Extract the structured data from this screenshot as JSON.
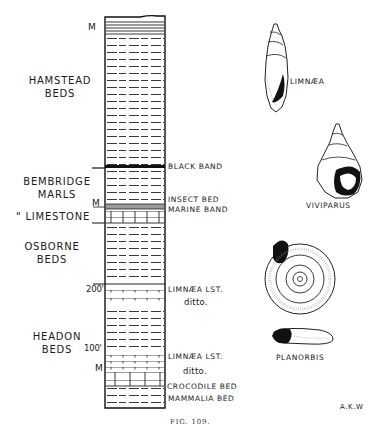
{
  "figure": {
    "caption": "FIG. 109.",
    "signature": "A.K.W"
  },
  "units": [
    {
      "name": "HAMSTEAD",
      "sub": "BEDS"
    },
    {
      "name": "BEMBRIDGE",
      "sub": "MARLS"
    },
    {
      "name": "\" LIMESTONE",
      "sub": ""
    },
    {
      "name": "OSBORNE",
      "sub": "BEDS"
    },
    {
      "name": "HEADON",
      "sub": "BEDS"
    }
  ],
  "side_marks": {
    "m_top": "M",
    "m_marine": "M",
    "m_lower": "M",
    "depth_200": "200'",
    "depth_100": "100'"
  },
  "bed_labels": [
    {
      "text": "BLACK BAND"
    },
    {
      "text": "INSECT BED"
    },
    {
      "text": "MARINE BAND"
    },
    {
      "text": "LIMNÆA LST."
    },
    {
      "text": "ditto."
    },
    {
      "text": "LIMNÆA LST."
    },
    {
      "text": "ditto."
    },
    {
      "text": "CROCODILE BED"
    },
    {
      "text": "MAMMALIA BED"
    }
  ],
  "fossils": [
    {
      "name": "LIMNÆA",
      "icon": "high-spired-snail"
    },
    {
      "name": "VIVIPARUS",
      "icon": "conical-snail"
    },
    {
      "name": "PLANORBIS",
      "icon": "coiled-flat-snail"
    }
  ],
  "colors": {
    "ink": "#1a1a1a",
    "paper": "#ffffff"
  }
}
